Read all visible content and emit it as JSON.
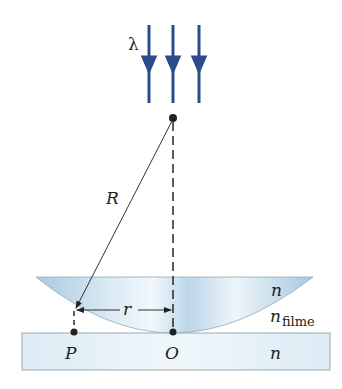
{
  "figure": {
    "labels": {
      "wavelength": "λ",
      "radius_of_curvature": "R",
      "ring_radius": "r",
      "lens_index": "n",
      "film_index": "n",
      "film_index_sub": "filme",
      "plate_index": "n",
      "point_p": "P",
      "point_o": "O"
    },
    "colors": {
      "arrow": "#2b4c8c",
      "lens_light": "#e6f1f8",
      "lens_dark": "#9fc3dd",
      "plate_light": "#eef6fb",
      "plate_border": "#9aa8b4",
      "line": "#333333"
    },
    "incident_rays": 3
  }
}
